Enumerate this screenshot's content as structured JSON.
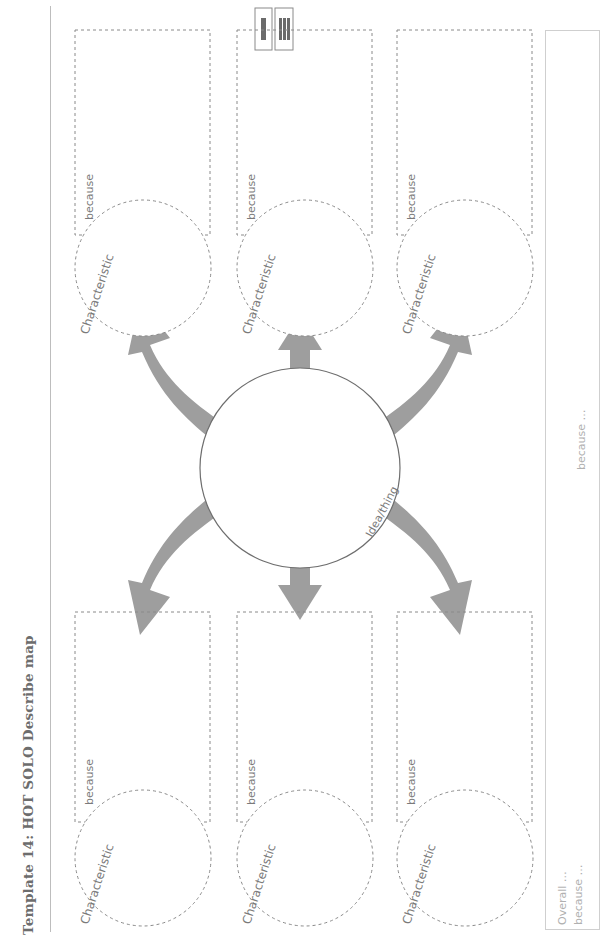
{
  "title": "Template 14: HOT SOLO Describe map",
  "icons": [
    {
      "name": "single-bar-icon",
      "bars": 1
    },
    {
      "name": "three-bars-icon",
      "bars": 3
    }
  ],
  "center": {
    "label": "Idea/thing"
  },
  "characteristics": [
    {
      "circle_label": "Characteristic",
      "box_label": "because"
    },
    {
      "circle_label": "Characteristic",
      "box_label": "because"
    },
    {
      "circle_label": "Characteristic",
      "box_label": "because"
    },
    {
      "circle_label": "Characteristic",
      "box_label": "because"
    },
    {
      "circle_label": "Characteristic",
      "box_label": "because"
    },
    {
      "circle_label": "Characteristic",
      "box_label": "because"
    }
  ],
  "overall": {
    "line1": "Overall …",
    "line2": "because …",
    "mid_label": "because …"
  },
  "colors": {
    "arrow": "#9e9e9e",
    "dash": "#8a8a8a",
    "text": "#7a7a7a",
    "title": "#6d6d6d"
  }
}
